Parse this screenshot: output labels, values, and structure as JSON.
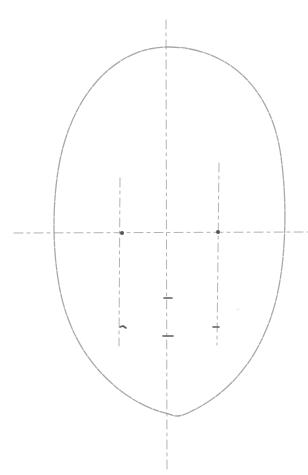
{
  "drawing": {
    "subject": "face proportion guide sketch",
    "medium": "pencil",
    "colors": {
      "paper": "#ffffff",
      "graphite_light": "#9a9a9a",
      "graphite_dark": "#555555"
    },
    "elements": [
      "head-oval",
      "vertical-center-line",
      "horizontal-eye-line",
      "left-eye-guide",
      "right-eye-guide",
      "left-eye-mark",
      "right-eye-mark",
      "nose-mark",
      "mouth-mark",
      "left-mouth-corner-mark",
      "right-mouth-corner-mark"
    ]
  }
}
